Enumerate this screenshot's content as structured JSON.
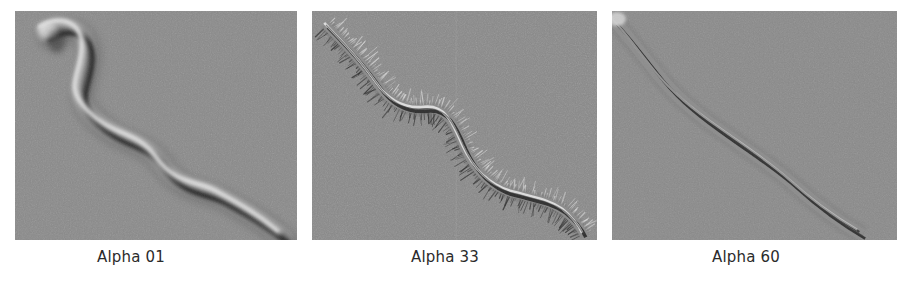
{
  "figure": {
    "background_color": "#ffffff",
    "width": 912,
    "height": 283,
    "modality": "DIC light micrograph series"
  },
  "panels": [
    {
      "id": "panel-1",
      "caption": "Alpha 01",
      "specimen_icon": "worm-smooth-thick-icon",
      "background_color": "#8a8a8a",
      "appearance": "smooth thick sinusoidal body, soft out-of-focus edges, no bristles",
      "body_width": 17,
      "bristles": false,
      "edge_sharpness": "soft",
      "path": "M 30,22 C 46,10 74,14 72,44 C 70,72 54,82 78,106 C 104,132 128,126 146,152 C 166,180 188,176 206,186 C 228,198 246,208 268,226"
    },
    {
      "id": "panel-2",
      "caption": "Alpha 33",
      "specimen_icon": "worm-bristled-icon",
      "background_color": "#8a8a8a",
      "appearance": "slender body fringed with dense perpendicular bristles along both margins",
      "body_width": 7,
      "bristles": true,
      "bristle_count": 150,
      "bristle_length": 15,
      "edge_sharpness": "sharp",
      "seam_x": 144,
      "path": "M 14,14 C 34,34 52,54 66,74 C 80,94 96,100 114,98 C 134,96 142,112 152,136 C 164,162 180,176 200,182 C 222,188 238,190 252,200 C 262,208 268,216 272,224"
    },
    {
      "id": "panel-3",
      "caption": "Alpha 60",
      "specimen_icon": "worm-thin-sharp-icon",
      "background_color": "#8a8a8a",
      "appearance": "thin double-outlined smooth body, crisp dark margins, no bristles",
      "body_width": 11,
      "bristles": false,
      "edge_sharpness": "crisp",
      "path": "M 2,10 C 16,24 30,44 48,66 C 66,88 86,104 112,122 C 140,142 162,156 182,174 C 204,194 226,210 250,224"
    }
  ],
  "colors": {
    "panel_background": "#8a8a8a",
    "caption_text": "#2b2b2b",
    "page_background": "#ffffff",
    "specimen_shadow": "#2e2e2e",
    "specimen_highlight": "#e8e8e8",
    "specimen_body": "#8f8f8f"
  }
}
